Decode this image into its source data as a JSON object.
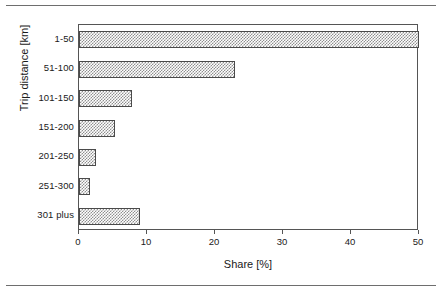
{
  "figure": {
    "background_color": "#ffffff",
    "frame_color": "#555555",
    "bar_fill_color": "#8f8f8f",
    "bar_border_color": "#4a4a4a",
    "rule_color": "#6e6e6e"
  },
  "chart_data": {
    "type": "bar",
    "orientation": "horizontal",
    "title": "",
    "xlabel": "Share [%]",
    "ylabel": "Trip distance [km]",
    "categories": [
      "1-50",
      "51-100",
      "101-150",
      "151-200",
      "201-250",
      "251-300",
      "301 plus"
    ],
    "values": [
      50.0,
      23.0,
      7.8,
      5.3,
      2.5,
      1.6,
      9.0
    ],
    "xlim": [
      0,
      50
    ],
    "xticks": [
      0,
      10,
      20,
      30,
      40,
      50
    ],
    "xtick_labels": [
      "0",
      "10",
      "20",
      "30",
      "40",
      "50"
    ],
    "grid": false,
    "legend": null
  }
}
